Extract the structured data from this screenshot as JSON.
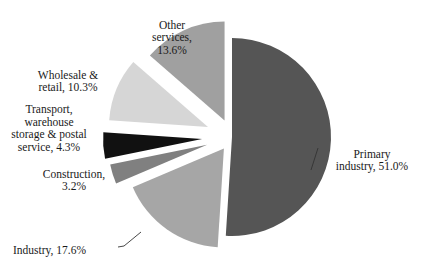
{
  "chart_data": {
    "type": "pie",
    "title": "",
    "start_angle_deg": 0,
    "direction": "clockwise",
    "slices": [
      {
        "name": "Primary industry",
        "value": 51.0,
        "label_lines": [
          "Primary",
          "industry, 51.0%"
        ],
        "color": "#555555",
        "exploded": false
      },
      {
        "name": "Industry",
        "value": 17.6,
        "label_lines": [
          "Industry, 17.6%"
        ],
        "color": "#a6a6a6",
        "exploded": true
      },
      {
        "name": "Construction",
        "value": 3.2,
        "label_lines": [
          "Construction,",
          "3.2%"
        ],
        "color": "#808080",
        "exploded": true
      },
      {
        "name": "Transport, warehouse storage & postal service",
        "value": 4.3,
        "label_lines": [
          "Transport,",
          "warehouse",
          "storage & postal",
          "service, 4.3%"
        ],
        "color": "#111111",
        "exploded": true
      },
      {
        "name": "Wholesale & retail",
        "value": 10.3,
        "label_lines": [
          "Wholesale &",
          "retail, 10.3%"
        ],
        "color": "#d6d6d6",
        "exploded": true
      },
      {
        "name": "Other services",
        "value": 13.6,
        "label_lines": [
          "Other",
          "services,",
          "13.6%"
        ],
        "color": "#a0a0a0",
        "exploded": true
      }
    ],
    "legend": "none"
  }
}
